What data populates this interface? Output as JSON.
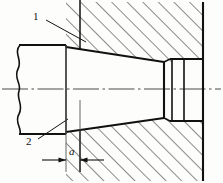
{
  "drawing": {
    "title": "Tapered shaft-hub cross-section",
    "type": "engineering-cross-section",
    "view": "half-section side view",
    "canvas": {
      "width": 223,
      "height": 183
    },
    "colors": {
      "outline": "#111111",
      "hatch": "#222222",
      "centerline": "#444444",
      "background": "#fdfdfb",
      "dimension": "#111111"
    },
    "labels": {
      "leader_1": "1",
      "leader_2": "2",
      "dimension_a": "a"
    },
    "leaders": [
      {
        "id": "leader-1",
        "text": "1",
        "label_pos": {
          "x": 33,
          "y": 11
        },
        "line_from": {
          "x": 46,
          "y": 20
        },
        "line_to": {
          "x": 84,
          "y": 41
        },
        "points_to": "taper-start-upper"
      },
      {
        "id": "leader-2",
        "text": "2",
        "label_pos": {
          "x": 26,
          "y": 136
        },
        "line_from": {
          "x": 38,
          "y": 136
        },
        "line_to": {
          "x": 66,
          "y": 119
        },
        "points_to": "shaft-lower-edge"
      }
    ],
    "dimension": {
      "label": "a",
      "label_pos": {
        "x": 69,
        "y": 146
      },
      "line_y": 160,
      "from_x": 66,
      "to_x": 80,
      "extension_lines": [
        {
          "x": 66,
          "y1": 45,
          "y2": 172
        },
        {
          "x": 80,
          "y1": 100,
          "y2": 172
        }
      ],
      "arrow_style": "inward-filled"
    },
    "centerline": {
      "y": 89,
      "x1": 2,
      "x2": 221,
      "style": "dash-dot"
    },
    "geometry": {
      "shaft": {
        "break_line_x": 18,
        "top_y": 45,
        "bottom_y": 134,
        "right_x": 66
      },
      "taper": {
        "start_x": 66,
        "start_top_y": 47,
        "start_bottom_y": 132,
        "end_x": 164,
        "end_top_y": 62,
        "end_bottom_y": 118
      },
      "collar": {
        "x1": 164,
        "x2": 172,
        "top_y": 62,
        "bottom_y": 118
      },
      "bore": {
        "x1": 172,
        "x2": 184,
        "top_y": 59,
        "bottom_y": 121
      },
      "housing": {
        "left_x": 80,
        "right_x": 203,
        "top_y": 2,
        "bottom_y": 181
      }
    },
    "hatching": {
      "angle_deg": 45,
      "direction": "up-right",
      "spacing_px": 11,
      "regions": [
        "housing-upper",
        "housing-lower"
      ]
    }
  }
}
